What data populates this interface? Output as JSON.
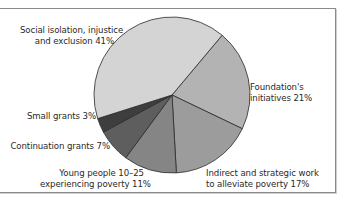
{
  "chart_data": {
    "type": "pie",
    "title": "",
    "categories": [
      "Social isolation, injustice and exclusion",
      "Foundation's initiatives",
      "Indirect and strategic work to alleviate poverty",
      "Young people 10–25 experiencing poverty",
      "Continuation grants",
      "Small grants"
    ],
    "values": [
      41,
      21,
      17,
      11,
      7,
      3
    ],
    "unit": "%",
    "colors": [
      "#d4d4d4",
      "#b3b3b3",
      "#9c9c9c",
      "#858585",
      "#5e5e5e",
      "#3e3e3e"
    ],
    "legend": "none (direct labels)"
  },
  "labels": {
    "social": {
      "line1": "Social isolation, injustice",
      "line2": "and exclusion 41%"
    },
    "foundation": {
      "line1": "Foundation's",
      "line2": "initiatives 21%"
    },
    "indirect": {
      "line1": "Indirect and strategic work",
      "line2": "to alleviate poverty 17%"
    },
    "young": {
      "line1": "Young people 10–25",
      "line2": "experiencing poverty 11%"
    },
    "continuation": {
      "line1": "Continuation grants 7%"
    },
    "small": {
      "line1": "Small grants 3%"
    }
  }
}
